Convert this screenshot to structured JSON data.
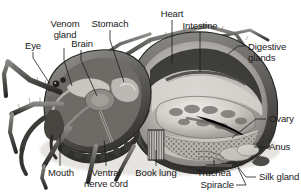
{
  "figure": {
    "background_color": "#ffffff",
    "ink_color": "#1a1a1a",
    "width": 301,
    "height": 196
  },
  "labels": {
    "eye": "Eye",
    "venom_gland_line1": "Venom",
    "venom_gland_line2": "gland",
    "brain": "Brain",
    "stomach": "Stomach",
    "heart": "Heart",
    "intestine": "Intestine",
    "digestive_glands_line1": "Digestive",
    "digestive_glands_line2": "glands",
    "ovary": "Ovary",
    "anus": "Anus",
    "silk_gland": "Silk gland",
    "spiracle": "Spiracle",
    "trachea": "Trachea",
    "book_lung": "Book lung",
    "ventral_nerve_cord_line1": "Ventral",
    "ventral_nerve_cord_line2": "nerve cord",
    "mouth": "Mouth"
  },
  "anatomy_parts": [
    "Eye",
    "Venom gland",
    "Brain",
    "Stomach",
    "Heart",
    "Intestine",
    "Digestive glands",
    "Ovary",
    "Anus",
    "Silk gland",
    "Spiracle",
    "Trachea",
    "Book lung",
    "Ventral nerve cord",
    "Mouth"
  ]
}
